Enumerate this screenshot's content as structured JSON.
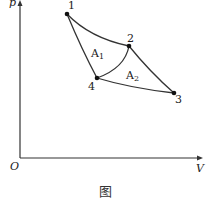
{
  "diagram": {
    "type": "p-V cycle",
    "axes": {
      "y_label": "p",
      "x_label": "V",
      "origin_label": "O"
    },
    "points": [
      {
        "id": "1",
        "label": "1"
      },
      {
        "id": "2",
        "label": "2"
      },
      {
        "id": "3",
        "label": "3"
      },
      {
        "id": "4",
        "label": "4"
      }
    ],
    "regions": [
      {
        "label": "A",
        "subscript": "1"
      },
      {
        "label": "A",
        "subscript": "2"
      }
    ],
    "caption": "图"
  }
}
